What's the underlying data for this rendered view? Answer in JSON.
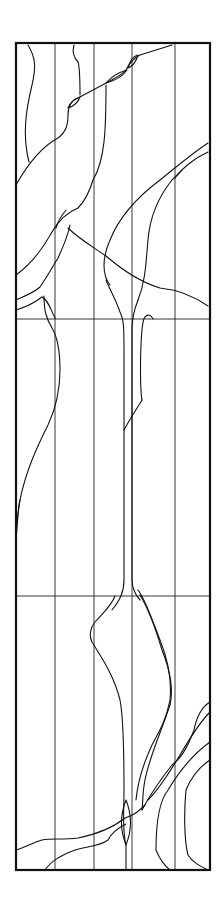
{
  "artwork": {
    "type": "stained glass line drawing",
    "panel_sections": 3,
    "stroke_color": "#111111",
    "background_color": "#ffffff"
  }
}
